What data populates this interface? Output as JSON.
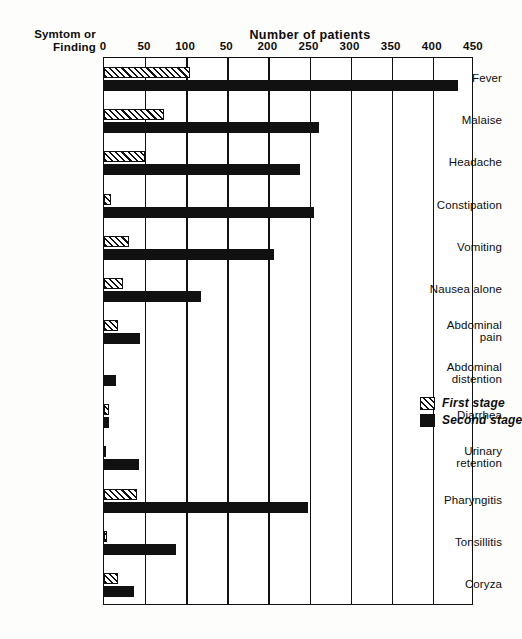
{
  "header": {
    "y_axis_title_line1": "Symtom or",
    "y_axis_title_line2": "Finding",
    "x_axis_title": "Number of patients"
  },
  "legend": {
    "items": [
      {
        "label": "First stage",
        "swatch": "hatched-swatch",
        "color": "#111111"
      },
      {
        "label": "Second stage",
        "swatch": "solid-black-swatch",
        "color": "#111111"
      }
    ]
  },
  "chart_data": {
    "type": "bar",
    "orientation": "horizontal",
    "title": "",
    "xlabel": "Number of patients",
    "ylabel": "Symtom or Finding",
    "xlim": [
      0,
      450
    ],
    "grid": true,
    "legend_position": "inside-right",
    "tick_values": [
      0,
      50,
      100,
      150,
      200,
      250,
      300,
      350,
      400,
      450
    ],
    "tick_labels": [
      "0",
      "50",
      "100",
      "50",
      "200",
      "250",
      "300",
      "350",
      "400",
      "450"
    ],
    "categories": [
      "Fever",
      "Malaise",
      "Headache",
      "Constipation",
      "Vomiting",
      "Nausea alone",
      "Abdominal pain",
      "Abdominal distention",
      "Diarrhea",
      "Urinary retention",
      "Pharyngitis",
      "Tonsillitis",
      "Coryza"
    ],
    "category_lines": [
      [
        "Fever"
      ],
      [
        "Malaise"
      ],
      [
        "Headache"
      ],
      [
        "Constipation"
      ],
      [
        "Vomiting"
      ],
      [
        "Nausea alone"
      ],
      [
        "Abdominal",
        "pain"
      ],
      [
        "Abdominal",
        "distention"
      ],
      [
        "Diarrhea"
      ],
      [
        "Urinary",
        "retention"
      ],
      [
        "Pharyngitis"
      ],
      [
        "Tonsillitis"
      ],
      [
        "Coryza"
      ]
    ],
    "series": [
      {
        "name": "First stage",
        "values": [
          105,
          73,
          50,
          8,
          30,
          23,
          17,
          0,
          6,
          2,
          40,
          4,
          17
        ]
      },
      {
        "name": "Second stage",
        "values": [
          430,
          262,
          238,
          256,
          207,
          118,
          44,
          14,
          6,
          42,
          248,
          88,
          36
        ]
      }
    ]
  }
}
